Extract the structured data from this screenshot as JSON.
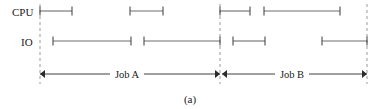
{
  "figure": {
    "caption": "(a)",
    "rows": [
      {
        "key": "cpu",
        "label": "CPU",
        "label_x": 12,
        "label_y": 16,
        "y": 11
      },
      {
        "key": "io",
        "label": "IO",
        "label_x": 21,
        "label_y": 46,
        "y": 41
      }
    ],
    "dividers": [
      {
        "name": "job-a-start",
        "x": 40,
        "y1": 4,
        "y2": 84
      },
      {
        "name": "job-a-end-job-b-start",
        "x": 220,
        "y1": 4,
        "y2": 84
      },
      {
        "name": "job-b-end",
        "x": 367,
        "y1": 4,
        "y2": 84
      }
    ],
    "bars": {
      "cpu": [
        {
          "name": "cpu-burst-1",
          "x1": 40,
          "x2": 72
        },
        {
          "name": "cpu-burst-2",
          "x1": 130,
          "x2": 163
        },
        {
          "name": "cpu-burst-3",
          "x1": 220,
          "x2": 250
        },
        {
          "name": "cpu-burst-4",
          "x1": 264,
          "x2": 340
        }
      ],
      "io": [
        {
          "name": "io-burst-1",
          "x1": 53,
          "x2": 131
        },
        {
          "name": "io-burst-2",
          "x1": 144,
          "x2": 220
        },
        {
          "name": "io-burst-3",
          "x1": 233,
          "x2": 265
        },
        {
          "name": "io-burst-4",
          "x1": 322,
          "x2": 367
        }
      ]
    },
    "spans": [
      {
        "name": "job-a-span",
        "label": "Job A",
        "x1": 40,
        "x2": 220,
        "y": 74,
        "label_x": 127,
        "label_y": 78,
        "label_half_width": 17
      },
      {
        "name": "job-b-span",
        "label": "Job B",
        "x1": 222,
        "x2": 367,
        "y": 74,
        "label_x": 292,
        "label_y": 78,
        "label_half_width": 17
      }
    ],
    "caption_x": 190,
    "caption_y": 103,
    "cap_half_height": 4.5,
    "colors": {
      "bar_stroke": "#6e6e6e",
      "cap_stroke": "#4a4a4a",
      "divider_stroke": "#9a9a9a",
      "span_stroke": "#2b2b2b",
      "text": "#1a1a1a",
      "background": "#ffffff"
    }
  }
}
